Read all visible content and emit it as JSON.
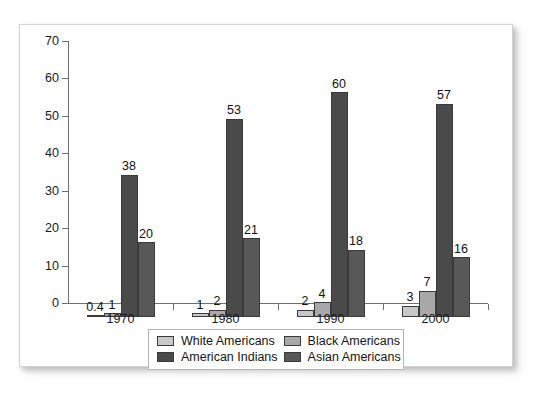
{
  "chart_data": {
    "type": "bar",
    "title": "",
    "subtitle": "",
    "xlabel": "",
    "ylabel": "",
    "categories": [
      "1970",
      "1980",
      "1990",
      "2000"
    ],
    "ylim": [
      0,
      70
    ],
    "yticks": [
      0,
      10,
      20,
      30,
      40,
      50,
      60,
      70
    ],
    "ytick_labels": [
      "0",
      "10",
      "20",
      "30",
      "40",
      "50",
      "60",
      "70"
    ],
    "grid": false,
    "legend_position": "bottom-center",
    "series": [
      {
        "name": "White Americans",
        "color": "#c8c8c8",
        "values": [
          0.4,
          1,
          2,
          3
        ],
        "labels": [
          "0.4",
          "1",
          "2",
          "3"
        ]
      },
      {
        "name": "Black Americans",
        "color": "#a8a8a8",
        "values": [
          1,
          2,
          4,
          7
        ],
        "labels": [
          "1",
          "2",
          "4",
          "7"
        ]
      },
      {
        "name": "American Indians",
        "color": "#4a4a4a",
        "values": [
          38,
          53,
          60,
          57
        ],
        "labels": [
          "38",
          "53",
          "60",
          "57"
        ]
      },
      {
        "name": "Asian Americans",
        "color": "#585858",
        "values": [
          20,
          21,
          18,
          16
        ],
        "labels": [
          "20",
          "21",
          "18",
          "16"
        ]
      }
    ]
  },
  "legend": {
    "entries": [
      {
        "label": "White Americans"
      },
      {
        "label": "Black Americans"
      },
      {
        "label": "American Indians"
      },
      {
        "label": "Asian Americans"
      }
    ]
  },
  "axis": {
    "y_labels": [
      "70",
      "60",
      "50",
      "40",
      "30",
      "20",
      "10",
      "0"
    ],
    "x_labels": [
      "1970",
      "1980",
      "1990",
      "2000"
    ]
  }
}
